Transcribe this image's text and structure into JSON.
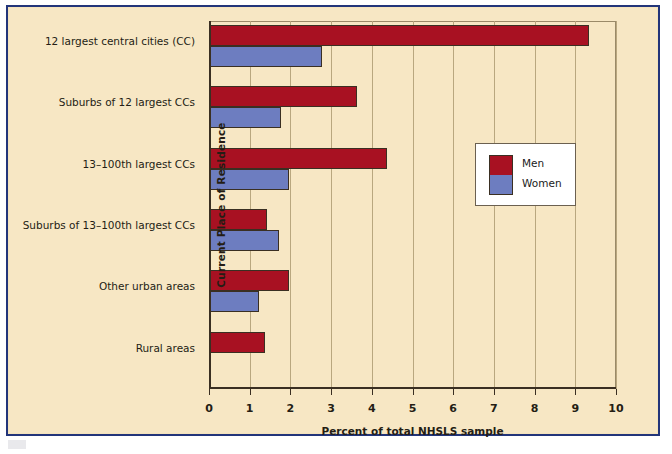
{
  "figure": {
    "background_color": "#f7e7c4",
    "frame_color": "#22357a"
  },
  "chart_data": {
    "type": "bar",
    "orientation": "horizontal",
    "title": "",
    "xlabel": "Percent of total NHSLS sample",
    "ylabel": "Current Place of Residence",
    "xlim": [
      0,
      10
    ],
    "xticks": [
      "0",
      "1",
      "2",
      "3",
      "4",
      "5",
      "6",
      "7",
      "8",
      "9",
      "10"
    ],
    "grid": "vertical",
    "categories": [
      "12 largest central cities (CC)",
      "Suburbs of 12 largest CCs",
      "13–100th largest CCs",
      "Suburbs of 13–100th largest CCs",
      "Other urban areas",
      "Rural areas"
    ],
    "series": [
      {
        "name": "Men",
        "color": "#a81122",
        "values": [
          9.3,
          3.6,
          4.35,
          1.4,
          1.95,
          1.35
        ]
      },
      {
        "name": "Women",
        "color": "#6d7dc0",
        "values": [
          2.75,
          1.75,
          1.95,
          1.7,
          1.2,
          0
        ]
      }
    ],
    "legend": {
      "position": "center-right",
      "entries": [
        "Men",
        "Women"
      ]
    }
  },
  "legend": {
    "men_label": "Men",
    "women_label": "Women"
  },
  "axis": {
    "x_title": "Percent of total NHSLS sample",
    "y_title": "Current Place of Residence"
  }
}
